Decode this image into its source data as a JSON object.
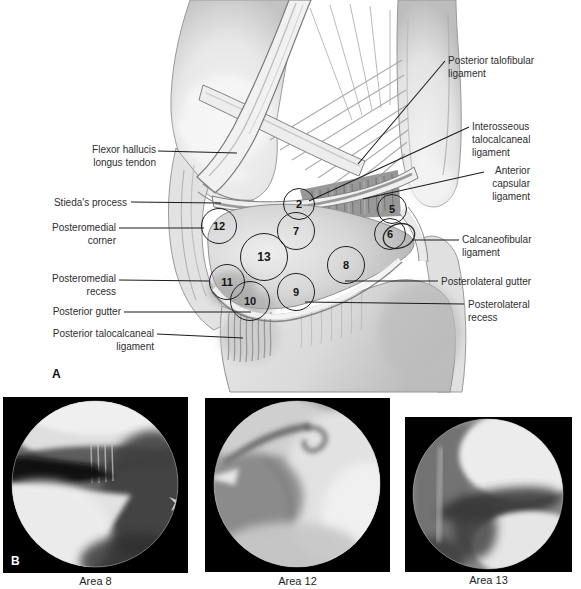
{
  "figure": {
    "panel_a_label": "A",
    "panel_b_label": "B"
  },
  "panel_a": {
    "left_labels": [
      {
        "name": "flexor-hallucis-longus-tendon",
        "text": "Flexor hallucis\nlongus tendon"
      },
      {
        "name": "stiedas-process",
        "text": "Stieda's process"
      },
      {
        "name": "posteromedial-corner",
        "text": "Posteromedial\ncorner"
      },
      {
        "name": "posteromedial-recess",
        "text": "Posteromedial\nrecess"
      },
      {
        "name": "posterior-gutter",
        "text": "Posterior gutter"
      },
      {
        "name": "posterior-talocalcaneal-ligament",
        "text": "Posterior talocalcaneal\nligament"
      }
    ],
    "right_labels": [
      {
        "name": "posterior-talofibular-ligament",
        "text": "Posterior talofibular\nligament"
      },
      {
        "name": "interosseous-talocalcaneal-ligament",
        "text": "Interosseous\ntalocalcaneal\nligament"
      },
      {
        "name": "anterior-capsular-ligament",
        "text": "Anterior\ncapsular\nligament"
      },
      {
        "name": "calcaneofibular-ligament",
        "text": "Calcaneofibular\nligament"
      },
      {
        "name": "posterolateral-gutter",
        "text": "Posterolateral gutter"
      },
      {
        "name": "posterolateral-recess",
        "text": "Posterolateral\nrecess"
      }
    ],
    "area_markers": [
      {
        "number": "2"
      },
      {
        "number": "5"
      },
      {
        "number": "6"
      },
      {
        "number": "7"
      },
      {
        "number": "8"
      },
      {
        "number": "9"
      },
      {
        "number": "10"
      },
      {
        "number": "11"
      },
      {
        "number": "12"
      },
      {
        "number": "13"
      }
    ]
  },
  "panel_b": {
    "photos": [
      {
        "caption": "Area 8"
      },
      {
        "caption": "Area 12"
      },
      {
        "caption": "Area 13"
      }
    ]
  }
}
